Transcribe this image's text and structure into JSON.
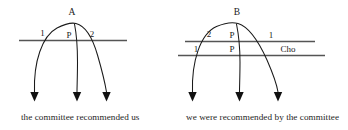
{
  "figure": {
    "background_color": "#ffffff",
    "ink_color": "#1a1a1a",
    "line_color": "#555555",
    "panels": [
      {
        "id": "left-panel",
        "caption": "the committee recommended us",
        "apex_label": "A",
        "rows": [
          {
            "id": "left-row-1",
            "labels": [
              "1",
              "P",
              "2"
            ]
          }
        ]
      },
      {
        "id": "right-panel",
        "caption": "we were recommended by the committee",
        "apex_label": "B",
        "rows": [
          {
            "id": "right-row-1",
            "labels": [
              "2",
              "P",
              "1"
            ]
          },
          {
            "id": "right-row-2",
            "labels": [
              "1",
              "P",
              "Cho"
            ]
          }
        ]
      }
    ]
  },
  "left": {
    "apex": "A",
    "label_1": "1",
    "label_p": "P",
    "label_2": "2",
    "caption": "the committee recommended us"
  },
  "right": {
    "apex": "B",
    "upper_label_left": "2",
    "upper_label_mid": "P",
    "upper_label_right": "1",
    "lower_label_left": "1",
    "lower_label_mid": "P",
    "lower_label_right": "Cho",
    "caption": "we were recommended by the committee"
  }
}
